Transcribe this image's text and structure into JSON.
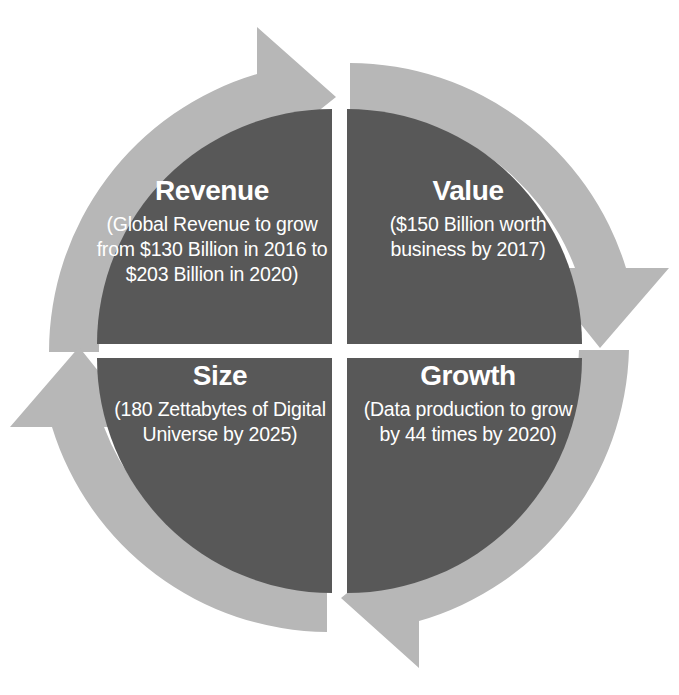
{
  "diagram": {
    "type": "cycle-4-stage",
    "direction": "clockwise",
    "colors": {
      "segment_fill": "#585858",
      "arrow_ring": "#b7b7b7",
      "text": "#ffffff",
      "background": "#ffffff"
    },
    "arrows": [
      {
        "name": "arrow-top",
        "points": "right"
      },
      {
        "name": "arrow-right",
        "points": "down"
      },
      {
        "name": "arrow-bottom",
        "points": "left"
      },
      {
        "name": "arrow-left",
        "points": "up"
      }
    ],
    "quadrants": [
      {
        "id": "revenue",
        "position": "top-left",
        "title": "Revenue",
        "body": "(Global Revenue to grow from $130 Billion in 2016 to $203 Billion in 2020)"
      },
      {
        "id": "value",
        "position": "top-right",
        "title": "Value",
        "body": "($150 Billion worth business by 2017)"
      },
      {
        "id": "size",
        "position": "bottom-left",
        "title": "Size",
        "body": "(180 Zettabytes of Digital Universe by 2025)"
      },
      {
        "id": "growth",
        "position": "bottom-right",
        "title": "Growth",
        "body": "(Data production to grow by 44 times by 2020)"
      }
    ]
  }
}
